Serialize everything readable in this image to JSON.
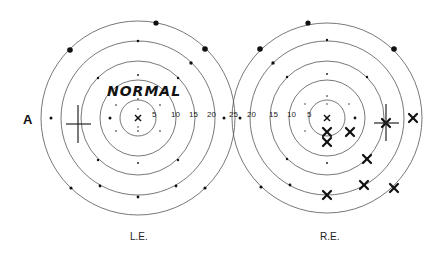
{
  "figure": {
    "side_label": "A",
    "annotation": "NORMAL",
    "left_eye_label": "L.E.",
    "right_eye_label": "R.E.",
    "ring_degrees": [
      "5",
      "10",
      "15",
      "20",
      "25"
    ],
    "left_scale_labels": [
      "5",
      "10",
      "15",
      "20",
      "25"
    ],
    "right_scale_labels": [
      "25",
      "20",
      "15",
      "10",
      "5"
    ]
  },
  "left_eye": {
    "center": [
      138,
      118
    ],
    "status": "normal",
    "test_points_seen": "all",
    "blind_spot_marker": [
      71,
      123
    ]
  },
  "right_eye": {
    "center": [
      327,
      118
    ],
    "blind_spot_marker": [
      386,
      123
    ],
    "missed_points": [
      [
        327,
        132
      ],
      [
        327,
        141
      ],
      [
        350,
        132
      ],
      [
        367,
        159
      ],
      [
        364,
        185
      ],
      [
        394,
        188
      ],
      [
        327,
        195
      ],
      [
        413,
        118
      ],
      [
        386,
        123
      ]
    ]
  }
}
